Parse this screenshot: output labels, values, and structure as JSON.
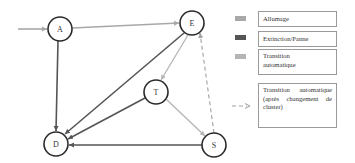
{
  "diagram": {
    "nodes": [
      {
        "id": "A",
        "label": "A",
        "x": 60,
        "y": 29
      },
      {
        "id": "E",
        "label": "E",
        "x": 192,
        "y": 23
      },
      {
        "id": "T",
        "label": "T",
        "x": 156,
        "y": 92
      },
      {
        "id": "S",
        "label": "S",
        "x": 214,
        "y": 145
      },
      {
        "id": "D",
        "label": "D",
        "x": 56,
        "y": 144
      }
    ],
    "edges": [
      {
        "from": "start",
        "to": "A",
        "type": "allumage"
      },
      {
        "from": "A",
        "to": "E",
        "type": "allumage"
      },
      {
        "from": "A",
        "to": "D",
        "type": "extinction"
      },
      {
        "from": "E",
        "to": "D",
        "type": "extinction"
      },
      {
        "from": "T",
        "to": "D",
        "type": "extinction"
      },
      {
        "from": "S",
        "to": "D",
        "type": "extinction"
      },
      {
        "from": "E",
        "to": "T",
        "type": "transition"
      },
      {
        "from": "T",
        "to": "S",
        "type": "transition"
      },
      {
        "from": "S",
        "to": "E",
        "type": "transition-cluster"
      }
    ]
  },
  "colors": {
    "allumage": "#a8a8a8",
    "extinction": "#555555",
    "transition": "#b5b5b5",
    "dashed": "#a0a0a0",
    "node_stroke": "#2a2a2a"
  },
  "legend": {
    "items": [
      {
        "label": "Allumage"
      },
      {
        "label": "Extinction/Panne"
      },
      {
        "label": "Transition automatique"
      },
      {
        "label": "Transition automatique (après changement de cluster)"
      }
    ]
  }
}
